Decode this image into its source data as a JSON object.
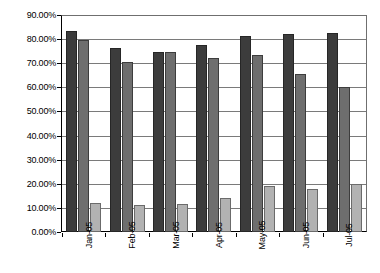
{
  "chart_data": {
    "type": "bar",
    "title": "",
    "subtitle": "",
    "xlabel": "",
    "ylabel": "",
    "categories": [
      "Jan-05",
      "Feb-05",
      "Mar-05",
      "Apr-05",
      "May-05",
      "Jun-05",
      "Jul-05"
    ],
    "series": [
      {
        "name": "Series 1",
        "color": "#3c3c3c",
        "values": [
          83.5,
          76.5,
          74.5,
          77.5,
          81.5,
          82.0,
          82.5
        ]
      },
      {
        "name": "Series 2",
        "color": "#6e6e6e",
        "values": [
          79.5,
          70.5,
          74.5,
          72.0,
          73.5,
          65.5,
          60.0
        ]
      },
      {
        "name": "Series 3",
        "color": "#b2b2b2",
        "values": [
          12.0,
          11.0,
          11.5,
          14.0,
          19.0,
          18.0,
          20.0
        ]
      }
    ],
    "ylim": [
      0,
      90
    ],
    "ytick_step": 10,
    "ytick_labels": [
      "0.00%",
      "10.00%",
      "20.00%",
      "30.00%",
      "40.00%",
      "50.00%",
      "60.00%",
      "70.00%",
      "80.00%",
      "90.00%"
    ],
    "ytick_values": [
      0,
      10,
      20,
      30,
      40,
      50,
      60,
      70,
      80,
      90
    ],
    "grid": true,
    "grid_axis": "y",
    "legend": false,
    "legend_position": "none",
    "value_suffix": "%",
    "plot_background": "#ffffff",
    "grid_color": "#7a7a7a",
    "axis_color": "#000000"
  }
}
